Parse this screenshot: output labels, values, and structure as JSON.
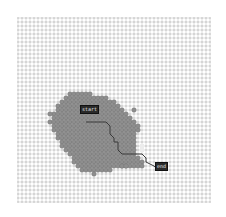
{
  "grid": {
    "origin": [
      18,
      18
    ],
    "spacing": 4,
    "cols": 49,
    "rows": 47,
    "grid_color": "#b8b8b8",
    "node_color": "#d0d0d0",
    "explored_color": "#8e8e8e",
    "explored_border": "#6f6f6f",
    "path_color": "#3a3a3a"
  },
  "explored_rows": [
    {
      "row": 19,
      "from": 13,
      "to": 18
    },
    {
      "row": 20,
      "from": 12,
      "to": 22
    },
    {
      "row": 21,
      "from": 11,
      "to": 24
    },
    {
      "row": 22,
      "from": 10,
      "to": 25
    },
    {
      "row": 23,
      "from": 10,
      "to": 26
    },
    {
      "row": 24,
      "from": 9,
      "to": 27
    },
    {
      "row": 25,
      "from": 9,
      "to": 28
    },
    {
      "row": 26,
      "from": 8,
      "to": 29
    },
    {
      "row": 27,
      "from": 9,
      "to": 29
    },
    {
      "row": 28,
      "from": 9,
      "to": 30
    },
    {
      "row": 29,
      "from": 10,
      "to": 29
    },
    {
      "row": 30,
      "from": 10,
      "to": 29
    },
    {
      "row": 31,
      "from": 11,
      "to": 29
    },
    {
      "row": 32,
      "from": 11,
      "to": 29
    },
    {
      "row": 33,
      "from": 12,
      "to": 29
    },
    {
      "row": 34,
      "from": 13,
      "to": 29
    },
    {
      "row": 35,
      "from": 14,
      "to": 30
    },
    {
      "row": 36,
      "from": 14,
      "to": 31
    },
    {
      "row": 37,
      "from": 15,
      "to": 31
    },
    {
      "row": 38,
      "from": 16,
      "to": 23
    }
  ],
  "explored_extra": [
    [
      8,
      24
    ],
    [
      29,
      23
    ],
    [
      30,
      27
    ],
    [
      19,
      39
    ],
    [
      26,
      37
    ],
    [
      27,
      37
    ]
  ],
  "blank_cells": [
    [
      31,
      32
    ],
    [
      31,
      33
    ]
  ],
  "path": [
    [
      17,
      26
    ],
    [
      22,
      26
    ],
    [
      23,
      27
    ],
    [
      23,
      29
    ],
    [
      24,
      30
    ],
    [
      24,
      31
    ],
    [
      25,
      31
    ],
    [
      25,
      33
    ],
    [
      26,
      34
    ],
    [
      29,
      34
    ],
    [
      31,
      34
    ],
    [
      32,
      35
    ],
    [
      32,
      36
    ],
    [
      34,
      37
    ],
    [
      35,
      38
    ]
  ],
  "start_label": {
    "text": "start",
    "x": 80,
    "y": 105
  },
  "end_label": {
    "text": "end",
    "x": 155,
    "y": 162
  }
}
